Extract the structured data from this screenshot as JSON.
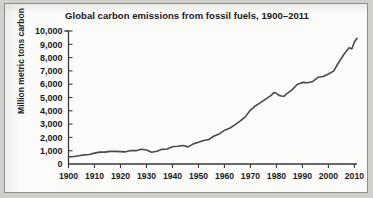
{
  "figure": {
    "title": "Global carbon emissions from fossil fuels, 1900–2011",
    "ylabel": "Million metric tons carbon"
  },
  "chart_data": {
    "type": "line",
    "title": "Global carbon emissions from fossil fuels, 1900–2011",
    "xlabel": "",
    "ylabel": "Million metric tons carbon",
    "xlim": [
      1900,
      2011
    ],
    "ylim": [
      0,
      10000
    ],
    "xticks": [
      1900,
      1910,
      1920,
      1930,
      1940,
      1950,
      1960,
      1970,
      1980,
      1990,
      2000,
      2010
    ],
    "xtick_labels": [
      "1900",
      "1910",
      "1920",
      "1930",
      "1940",
      "1950",
      "1960",
      "1970",
      "1980",
      "1990",
      "2000",
      "2010"
    ],
    "yticks": [
      0,
      1000,
      2000,
      3000,
      4000,
      5000,
      6000,
      7000,
      8000,
      9000,
      10000
    ],
    "ytick_labels": [
      "0",
      "1,000",
      "2,000",
      "3,000",
      "4,000",
      "5,000",
      "6,000",
      "7,000",
      "8,000",
      "9,000",
      "10,000"
    ],
    "grid": false,
    "legend": false,
    "line_color": "#4a4a4c",
    "series": [
      {
        "name": "Global carbon emissions from fossil fuels",
        "x": [
          1900,
          1902,
          1904,
          1906,
          1908,
          1910,
          1912,
          1914,
          1916,
          1918,
          1920,
          1922,
          1924,
          1926,
          1928,
          1930,
          1932,
          1934,
          1936,
          1938,
          1940,
          1942,
          1944,
          1946,
          1948,
          1950,
          1952,
          1954,
          1956,
          1958,
          1960,
          1962,
          1964,
          1966,
          1968,
          1970,
          1972,
          1974,
          1976,
          1978,
          1979,
          1980,
          1981,
          1982,
          1983,
          1984,
          1986,
          1988,
          1990,
          1992,
          1994,
          1996,
          1998,
          2000,
          2002,
          2004,
          2006,
          2008,
          2009,
          2010,
          2011
        ],
        "y": [
          534,
          566,
          617,
          687,
          718,
          819,
          891,
          895,
          949,
          947,
          932,
          915,
          1016,
          1004,
          1110,
          1057,
          882,
          964,
          1103,
          1132,
          1299,
          1334,
          1386,
          1289,
          1512,
          1630,
          1767,
          1844,
          2106,
          2260,
          2535,
          2690,
          2945,
          3219,
          3543,
          4053,
          4383,
          4629,
          4899,
          5160,
          5379,
          5316,
          5160,
          5110,
          5090,
          5296,
          5574,
          5973,
          6135,
          6105,
          6204,
          6518,
          6580,
          6766,
          6980,
          7650,
          8255,
          8749,
          8653,
          9167,
          9449
        ]
      }
    ],
    "annotations": []
  }
}
